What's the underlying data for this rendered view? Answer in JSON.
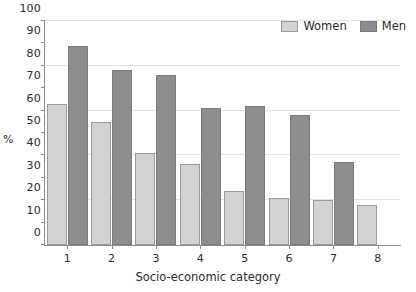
{
  "chart_data": {
    "type": "bar",
    "title": "",
    "xlabel": "Socio-economic category",
    "ylabel": "%",
    "categories": [
      "1",
      "2",
      "3",
      "4",
      "5",
      "6",
      "7",
      "8"
    ],
    "series": [
      {
        "name": "Women",
        "color": "#d2d2d2",
        "values": [
          63,
          55,
          41,
          36,
          24,
          21,
          20,
          18
        ]
      },
      {
        "name": "Men",
        "color": "#8d8d8d",
        "values": [
          89,
          78,
          76,
          61,
          62,
          58,
          37,
          null
        ]
      }
    ],
    "ylim": [
      0,
      100
    ],
    "ytick_values": [
      0,
      10,
      20,
      30,
      40,
      50,
      60,
      70,
      80,
      90,
      100
    ],
    "ytick_labels": [
      "0",
      "10",
      "20",
      "30",
      "40",
      "50",
      "60",
      "70",
      "80",
      "90",
      "100"
    ],
    "gridline_values": [
      20,
      40,
      60,
      80,
      100
    ],
    "grid": true,
    "legend_position": "top-right"
  }
}
